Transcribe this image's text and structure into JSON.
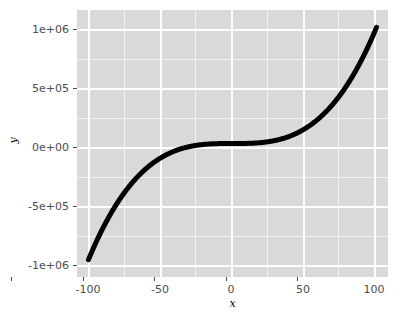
{
  "chart_data": {
    "type": "line",
    "title": "",
    "subtitle": "",
    "xlabel": "x",
    "ylabel": "y",
    "xlim": [
      -108,
      108
    ],
    "ylim": [
      -1150000,
      1150000
    ],
    "grid": true,
    "legend": null,
    "equation": "y = x^3",
    "x_ticks": [
      -100,
      -50,
      0,
      50,
      100
    ],
    "x_tick_labels": [
      "-100",
      "-50",
      "0",
      "50",
      "100"
    ],
    "y_ticks": [
      -1000000,
      -500000,
      0,
      500000,
      1000000
    ],
    "y_tick_labels": [
      "-1e+06",
      "-5e+05",
      "0e+00",
      "5e+05",
      "1e+06"
    ],
    "x": [
      -100,
      -95,
      -90,
      -85,
      -80,
      -75,
      -70,
      -65,
      -60,
      -55,
      -50,
      -45,
      -40,
      -35,
      -30,
      -25,
      -20,
      -15,
      -10,
      -5,
      0,
      5,
      10,
      15,
      20,
      25,
      30,
      35,
      40,
      45,
      50,
      55,
      60,
      65,
      70,
      75,
      80,
      85,
      90,
      95,
      100
    ],
    "values": [
      -1000000,
      -857375,
      -729000,
      -614125,
      -512000,
      -421875,
      -343000,
      -274625,
      -216000,
      -166375,
      -125000,
      -91125,
      -64000,
      -42875,
      -27000,
      -15625,
      -8000,
      -3375,
      -1000,
      -125,
      0,
      125,
      1000,
      3375,
      8000,
      15625,
      27000,
      42875,
      64000,
      91125,
      125000,
      166375,
      216000,
      274625,
      343000,
      421875,
      512000,
      614125,
      729000,
      857375,
      1000000
    ],
    "series": [
      {
        "name": "y",
        "values": [
          -1000000,
          -857375,
          -729000,
          -614125,
          -512000,
          -421875,
          -343000,
          -274625,
          -216000,
          -166375,
          -125000,
          -91125,
          -64000,
          -42875,
          -27000,
          -15625,
          -8000,
          -3375,
          -1000,
          -125,
          0,
          125,
          1000,
          3375,
          8000,
          15625,
          27000,
          42875,
          64000,
          91125,
          125000,
          166375,
          216000,
          274625,
          343000,
          421875,
          512000,
          614125,
          729000,
          857375,
          1000000
        ],
        "color": "#000000"
      }
    ]
  },
  "colors": {
    "panel_background": "#D9D9D9",
    "grid_line": "#FFFFFF",
    "curve": "#000000",
    "tick_label": "#4D4D4D",
    "axis_title": "#000000",
    "plot_background": "#FFFFFF"
  }
}
